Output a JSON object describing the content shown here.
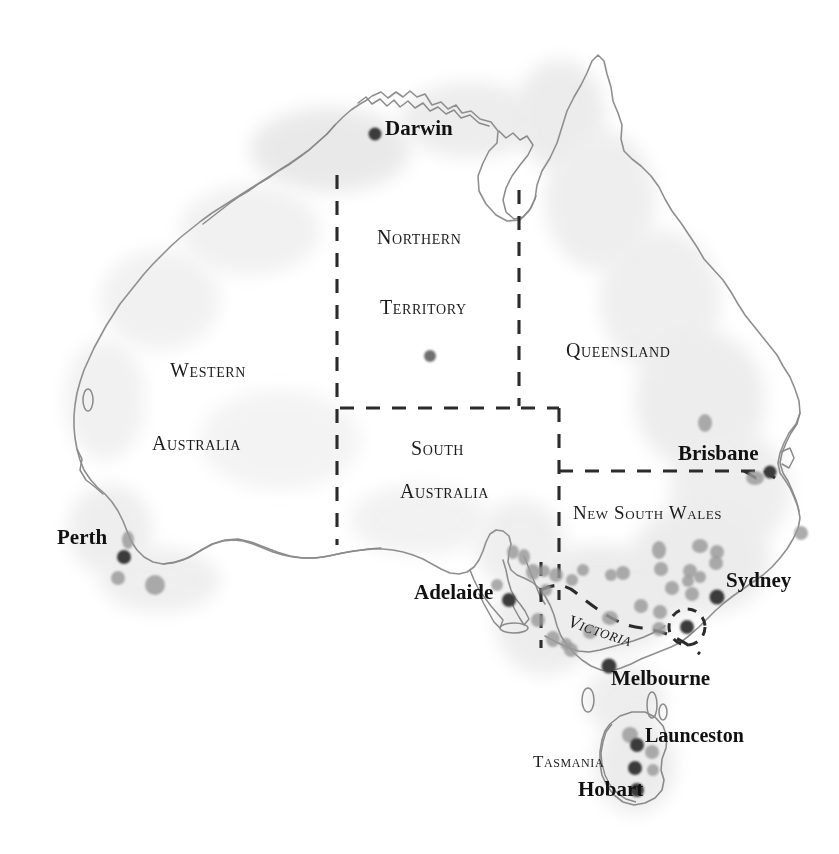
{
  "map": {
    "title": "Australia",
    "projection_note": "outline map of Australia with state borders",
    "background_color": "#ffffff",
    "coastline_color": "#8b8b8b",
    "border_color": "#2a2a2a",
    "city_dot_color": "#3a3a3a",
    "site_dot_color": "#9a9a9a",
    "land_shadow_color": "#d8d8d8"
  },
  "states": [
    {
      "id": "wa",
      "name": "Western Australia",
      "line1": "Western",
      "line2": "Australia",
      "x": 170,
      "y": 368,
      "x2": 152,
      "y2": 450
    },
    {
      "id": "nt",
      "name": "Northern Territory",
      "line1": "Northern",
      "line2": "Territory",
      "x": 377,
      "y": 232,
      "x2": 380,
      "y2": 302
    },
    {
      "id": "sa",
      "name": "South Australia",
      "line1": "South",
      "line2": "Australia",
      "x": 409,
      "y": 445,
      "x2": 400,
      "y2": 487
    },
    {
      "id": "qld",
      "name": "Queensland",
      "line1": "Queensland",
      "line2": "",
      "x": 566,
      "y": 346,
      "x2": 0,
      "y2": 0
    },
    {
      "id": "nsw",
      "name": "New South Wales",
      "line1": "New South Wales",
      "line2": "",
      "x": 573,
      "y": 509,
      "x2": 0,
      "y2": 0
    },
    {
      "id": "vic",
      "name": "Victoria",
      "line1": "Victoria",
      "line2": "",
      "x": 573,
      "y": 614,
      "x2": 0,
      "y2": 0
    },
    {
      "id": "tas",
      "name": "Tasmania",
      "line1": "Tasmania",
      "line2": "",
      "x": 533,
      "y": 760,
      "x2": 0,
      "y2": 0
    }
  ],
  "state_labels": {
    "western": "Western",
    "australia_w": "Australia",
    "northern": "Northern",
    "territory": "Territory",
    "south": "South",
    "australia_s": "Australia",
    "queensland": "Queensland",
    "new_south_wales": "New South Wales",
    "victoria": "Victoria",
    "tasmania": "Tasmania"
  },
  "cities": [
    {
      "name": "Darwin",
      "label_x": 385,
      "label_y": 126,
      "dot_x": 375,
      "dot_y": 134,
      "anchor": "left"
    },
    {
      "name": "Brisbane",
      "label_x": 678,
      "label_y": 451,
      "dot_x": 770,
      "dot_y": 472,
      "anchor": "left"
    },
    {
      "name": "Perth",
      "label_x": 57,
      "label_y": 535,
      "dot_x": 124,
      "dot_y": 557,
      "anchor": "left"
    },
    {
      "name": "Sydney",
      "label_x": 726,
      "label_y": 578,
      "dot_x": 717,
      "dot_y": 597,
      "anchor": "left"
    },
    {
      "name": "Adelaide",
      "label_x": 414,
      "label_y": 590,
      "dot_x": 509,
      "dot_y": 600,
      "anchor": "left"
    },
    {
      "name": "Melbourne",
      "label_x": 611,
      "label_y": 676,
      "dot_x": 609,
      "dot_y": 671,
      "anchor": "left"
    },
    {
      "name": "Launceston",
      "label_x": 645,
      "label_y": 733,
      "dot_x": 635,
      "dot_y": 742,
      "anchor": "left"
    },
    {
      "name": "Hobart",
      "label_x": 578,
      "label_y": 787,
      "dot_x": 637,
      "dot_y": 787,
      "anchor": "left"
    }
  ],
  "city_dots": [
    {
      "name": "Darwin",
      "x": 375,
      "y": 134,
      "r": 6.5
    },
    {
      "name": "Alice Springs",
      "x": 430,
      "y": 356,
      "r": 6.0
    },
    {
      "name": "Brisbane",
      "x": 770,
      "y": 472,
      "r": 6.5
    },
    {
      "name": "Perth",
      "x": 124,
      "y": 557,
      "r": 7.0
    },
    {
      "name": "Adelaide",
      "x": 509,
      "y": 600,
      "r": 7.0
    },
    {
      "name": "Sydney",
      "x": 717,
      "y": 597,
      "r": 7.5
    },
    {
      "name": "Canberra",
      "x": 687,
      "y": 627,
      "r": 7.0
    },
    {
      "name": "Melbourne",
      "x": 609,
      "y": 666,
      "r": 7.5
    },
    {
      "name": "Launceston",
      "x": 637,
      "y": 745,
      "r": 7.0
    },
    {
      "name": "Hobart",
      "x": 637,
      "y": 790,
      "r": 7.0
    },
    {
      "name": "Tasmania mid",
      "x": 635,
      "y": 768,
      "r": 7.0
    }
  ],
  "site_dots": [
    {
      "x": 128,
      "y": 540,
      "rx": 6,
      "ry": 9
    },
    {
      "x": 118,
      "y": 578,
      "rx": 7,
      "ry": 7
    },
    {
      "x": 155,
      "y": 585,
      "rx": 10,
      "ry": 10
    },
    {
      "x": 705,
      "y": 423,
      "rx": 7,
      "ry": 9
    },
    {
      "x": 755,
      "y": 478,
      "rx": 9,
      "ry": 7
    },
    {
      "x": 801,
      "y": 533,
      "rx": 7,
      "ry": 7
    },
    {
      "x": 700,
      "y": 546,
      "rx": 8,
      "ry": 7
    },
    {
      "x": 717,
      "y": 552,
      "rx": 7,
      "ry": 7
    },
    {
      "x": 659,
      "y": 550,
      "rx": 7,
      "ry": 9
    },
    {
      "x": 716,
      "y": 563,
      "rx": 7,
      "ry": 7
    },
    {
      "x": 661,
      "y": 569,
      "rx": 7,
      "ry": 7
    },
    {
      "x": 623,
      "y": 573,
      "rx": 7,
      "ry": 7
    },
    {
      "x": 690,
      "y": 571,
      "rx": 7,
      "ry": 7
    },
    {
      "x": 700,
      "y": 577,
      "rx": 6,
      "ry": 6
    },
    {
      "x": 688,
      "y": 581,
      "rx": 6,
      "ry": 6
    },
    {
      "x": 672,
      "y": 588,
      "rx": 7,
      "ry": 7
    },
    {
      "x": 692,
      "y": 594,
      "rx": 7,
      "ry": 7
    },
    {
      "x": 611,
      "y": 575,
      "rx": 6,
      "ry": 6
    },
    {
      "x": 583,
      "y": 570,
      "rx": 6,
      "ry": 6
    },
    {
      "x": 524,
      "y": 557,
      "rx": 6,
      "ry": 8
    },
    {
      "x": 533,
      "y": 572,
      "rx": 7,
      "ry": 8
    },
    {
      "x": 544,
      "y": 571,
      "rx": 6,
      "ry": 6
    },
    {
      "x": 556,
      "y": 575,
      "rx": 7,
      "ry": 7
    },
    {
      "x": 572,
      "y": 580,
      "rx": 6,
      "ry": 6
    },
    {
      "x": 546,
      "y": 590,
      "rx": 6,
      "ry": 6
    },
    {
      "x": 538,
      "y": 620,
      "rx": 7,
      "ry": 7
    },
    {
      "x": 553,
      "y": 639,
      "rx": 7,
      "ry": 8
    },
    {
      "x": 566,
      "y": 644,
      "rx": 6,
      "ry": 6
    },
    {
      "x": 497,
      "y": 585,
      "rx": 6,
      "ry": 6
    },
    {
      "x": 571,
      "y": 650,
      "rx": 7,
      "ry": 7
    },
    {
      "x": 590,
      "y": 632,
      "rx": 7,
      "ry": 7
    },
    {
      "x": 610,
      "y": 618,
      "rx": 8,
      "ry": 7
    },
    {
      "x": 641,
      "y": 606,
      "rx": 7,
      "ry": 7
    },
    {
      "x": 660,
      "y": 612,
      "rx": 7,
      "ry": 7
    },
    {
      "x": 659,
      "y": 629,
      "rx": 7,
      "ry": 7
    },
    {
      "x": 513,
      "y": 552,
      "rx": 6,
      "ry": 7
    },
    {
      "x": 630,
      "y": 735,
      "rx": 8,
      "ry": 8
    },
    {
      "x": 652,
      "y": 752,
      "rx": 7,
      "ry": 7
    },
    {
      "x": 653,
      "y": 770,
      "rx": 6,
      "ry": 6
    }
  ],
  "act_circle": {
    "name": "Australian Capital Territory",
    "cx": 687,
    "cy": 627,
    "r": 18
  }
}
